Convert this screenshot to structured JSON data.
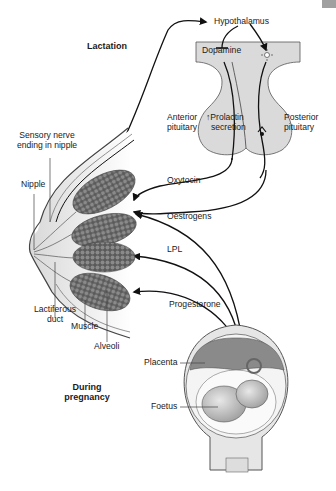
{
  "titles": {
    "lactation": "Lactation",
    "pregnancy_line1": "During",
    "pregnancy_line2": "pregnancy"
  },
  "brain": {
    "hypothalamus": "Hypothalamus",
    "dopamine": "Dopamine",
    "anterior_line1": "Anterior",
    "anterior_line2": "pituitary",
    "posterior_line1": "Posterior",
    "posterior_line2": "pituitary",
    "prolactin_line1": "↑Prolactin",
    "prolactin_line2": "secretion"
  },
  "breast": {
    "sensory_line1": "Sensory nerve",
    "sensory_line2": "ending in nipple",
    "nipple": "Nipple",
    "duct_line1": "Lactiferous",
    "duct_line2": "duct",
    "muscle": "Muscle",
    "alveoli": "Alveoli"
  },
  "hormones": {
    "oxytocin": "Oxytocin",
    "oestrogens": "Oestrogens",
    "lpl": "LPL",
    "progesterone": "Progesterone"
  },
  "uterus": {
    "placenta": "Placenta",
    "foetus": "Foetus"
  },
  "colors": {
    "pituitary_fill": "#d9d9d9",
    "alveoli_fill": "#6e6e6e",
    "line": "#111111"
  }
}
